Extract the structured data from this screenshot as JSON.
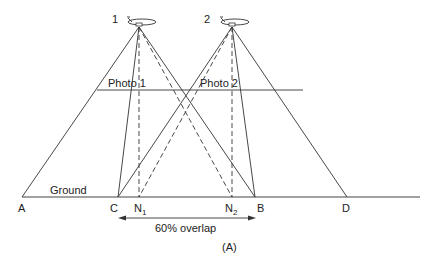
{
  "figure": {
    "label": "(A)",
    "overlap_text": "60% overlap"
  },
  "aircraft": [
    {
      "id": "1",
      "label": "1",
      "apex": [
        139,
        27
      ]
    },
    {
      "id": "2",
      "label": "2",
      "apex": [
        232,
        27
      ]
    }
  ],
  "photo_plane": {
    "labels": [
      "Photo 1",
      "Photo 2"
    ]
  },
  "ground": {
    "label": "Ground"
  },
  "points": {
    "A": "A",
    "C": "C",
    "N1": "N",
    "N1_sub": "1",
    "N2": "N",
    "N2_sub": "2",
    "B": "B",
    "D": "D"
  },
  "colors": {
    "line": "#333333",
    "text": "#222222",
    "background": "#ffffff"
  }
}
